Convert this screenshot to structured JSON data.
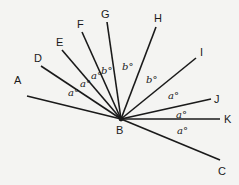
{
  "diagram": {
    "vertex": {
      "name": "B",
      "x": 121,
      "y": 119,
      "label_x": 116,
      "label_y": 134
    },
    "rays": [
      {
        "name": "A",
        "x": 27,
        "y": 96,
        "label_x": 14,
        "label_y": 84
      },
      {
        "name": "D",
        "x": 41,
        "y": 66,
        "label_x": 34,
        "label_y": 62
      },
      {
        "name": "E",
        "x": 62,
        "y": 50,
        "label_x": 56,
        "label_y": 46
      },
      {
        "name": "F",
        "x": 82,
        "y": 32,
        "label_x": 77,
        "label_y": 28
      },
      {
        "name": "G",
        "x": 107,
        "y": 22,
        "label_x": 101,
        "label_y": 18
      },
      {
        "name": "H",
        "x": 156,
        "y": 27,
        "label_x": 154,
        "label_y": 22
      },
      {
        "name": "I",
        "x": 196,
        "y": 58,
        "label_x": 200,
        "label_y": 56
      },
      {
        "name": "J",
        "x": 211,
        "y": 99,
        "label_x": 214,
        "label_y": 103
      },
      {
        "name": "K",
        "x": 220,
        "y": 119,
        "label_x": 224,
        "label_y": 123
      },
      {
        "name": "C",
        "x": 220,
        "y": 160,
        "label_x": 218,
        "label_y": 175
      }
    ],
    "angle_labels": [
      {
        "text": "a°",
        "x": 68,
        "y": 96,
        "between": "A-D"
      },
      {
        "text": "a°",
        "x": 80,
        "y": 87,
        "between": "D-E"
      },
      {
        "text": "a°",
        "x": 91,
        "y": 79,
        "between": "E-F"
      },
      {
        "text": "b°",
        "x": 101,
        "y": 74,
        "between": "F-G"
      },
      {
        "text": "b°",
        "x": 122,
        "y": 70,
        "between": "G-H"
      },
      {
        "text": "b°",
        "x": 146,
        "y": 83,
        "between": "H-I"
      },
      {
        "text": "a°",
        "x": 168,
        "y": 99,
        "between": "I-J"
      },
      {
        "text": "a°",
        "x": 176,
        "y": 118,
        "between": "J-K"
      },
      {
        "text": "a°",
        "x": 177,
        "y": 134,
        "between": "K-C"
      }
    ]
  }
}
